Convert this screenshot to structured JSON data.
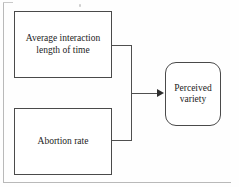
{
  "diagram": {
    "type": "flowchart",
    "background_color": "#fefefe",
    "stroke_color": "#4a4a4a",
    "text_color": "#1c1c1c",
    "nodes": [
      {
        "id": "average-interaction",
        "label": "Average interaction length of time",
        "shape": "rectangle",
        "role": "predictor"
      },
      {
        "id": "abortion-rate",
        "label": "Abortion rate",
        "shape": "rectangle",
        "role": "predictor"
      },
      {
        "id": "perceived-variety",
        "label": "Perceived variety",
        "shape": "rounded-rectangle",
        "role": "outcome"
      }
    ],
    "edges": [
      {
        "id": "edge-combined",
        "from": [
          "average-interaction",
          "abortion-rate"
        ],
        "to": "perceived-variety",
        "style": "merged-elbow",
        "arrowhead": "filled-triangle",
        "direction": "right"
      }
    ]
  }
}
